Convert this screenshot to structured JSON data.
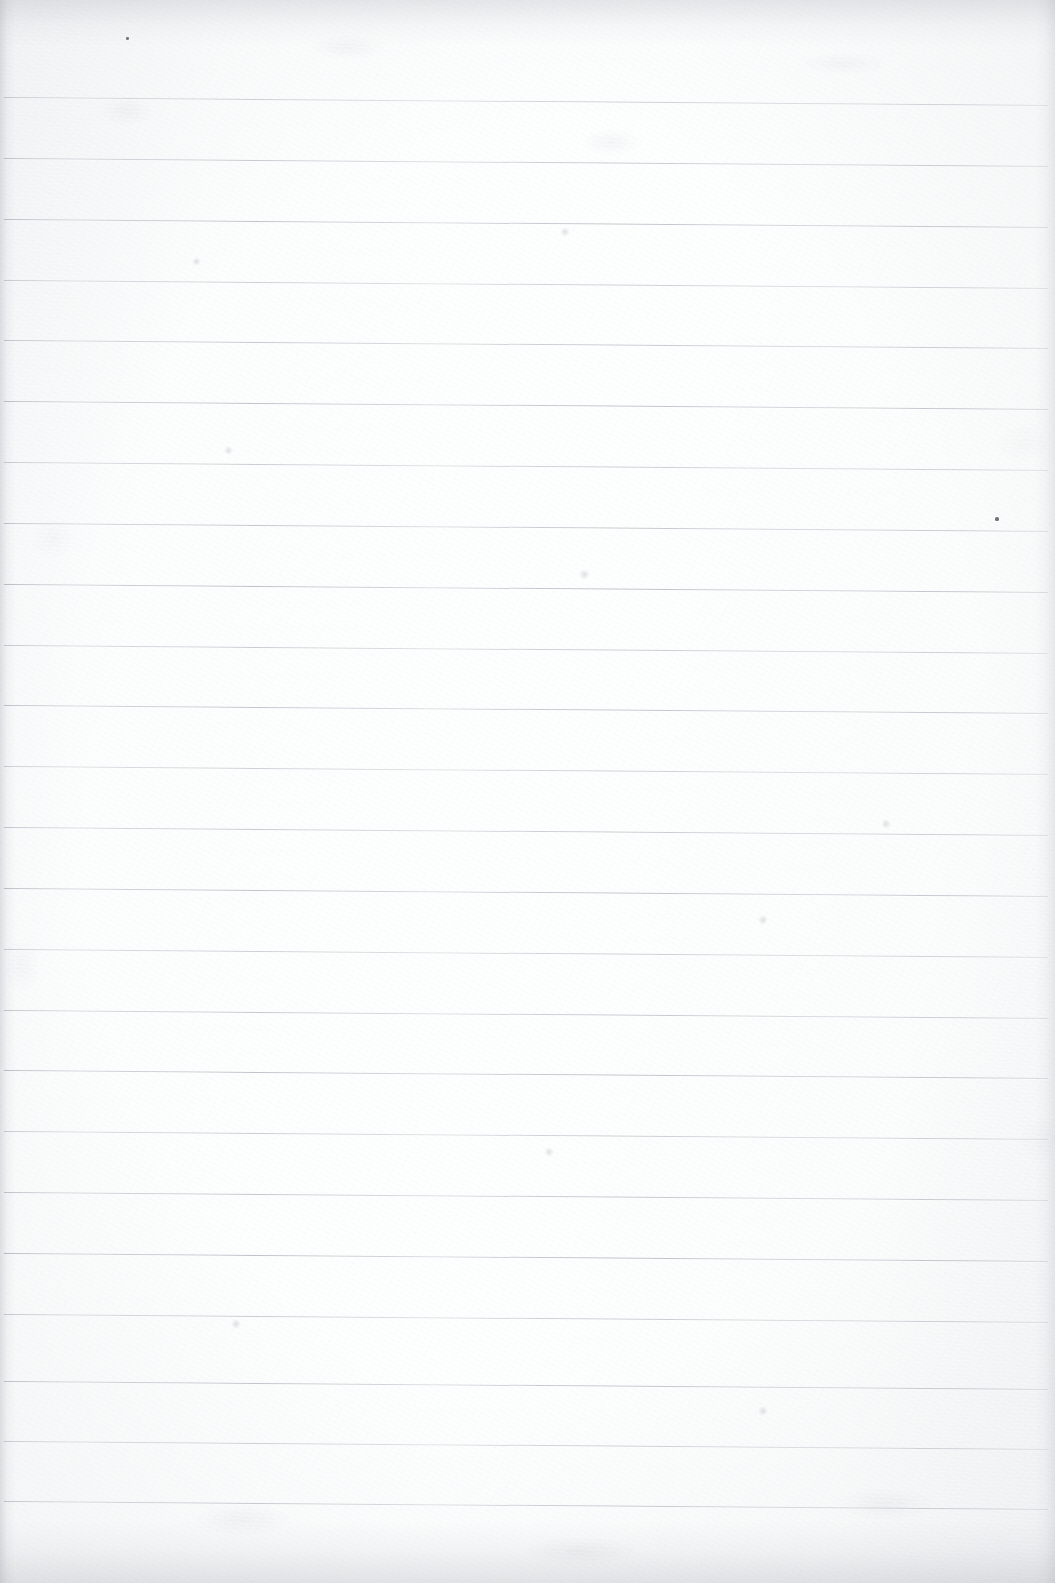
{
  "document": {
    "kind": "scanned-page",
    "surface": "blank ruled notebook paper",
    "orientation": "portrait",
    "width_px": 1055,
    "height_px": 1583,
    "written_content": "",
    "visible_text": ""
  },
  "colors": {
    "paper": "#fbfcfc",
    "paper_warm_edge": "#f6f7f8",
    "rule_line": "#a8afb7",
    "rule_line_light": "#c4cad0",
    "edge_shadow": "#92999f",
    "speck": "#6e757c"
  },
  "ruling": {
    "line_count": 24,
    "first_line_y": 97,
    "spacing_px": 60.8,
    "line_start_x": 4,
    "line_end_x": 1048,
    "line_thickness_px": 1,
    "skew_drop_px": 8,
    "description": "evenly spaced horizontal rules, slight downward skew to the right",
    "line_y": [
      97,
      158,
      219,
      280,
      340,
      401,
      462,
      523,
      584,
      645,
      705,
      766,
      827,
      888,
      949,
      1010,
      1070,
      1131,
      1192,
      1253,
      1314,
      1381,
      1441,
      1501
    ]
  },
  "artifacts": {
    "specks": [
      {
        "name": "speck-upper-left",
        "x": 126,
        "y": 37,
        "w": 3,
        "h": 3
      },
      {
        "name": "speck-right-margin",
        "x": 995,
        "y": 517,
        "w": 4,
        "h": 4
      }
    ],
    "soft_marks": [
      {
        "name": "smudge-upper-mid",
        "x": 565,
        "y": 232,
        "size": 10
      },
      {
        "name": "smudge-left-upper",
        "x": 196,
        "y": 261,
        "size": 9
      },
      {
        "name": "smudge-mid-left",
        "x": 228,
        "y": 450,
        "size": 9
      },
      {
        "name": "smudge-center",
        "x": 584,
        "y": 574,
        "size": 11
      },
      {
        "name": "smudge-right-upper",
        "x": 886,
        "y": 824,
        "size": 10
      },
      {
        "name": "smudge-right-mid",
        "x": 763,
        "y": 920,
        "size": 10
      },
      {
        "name": "smudge-center-low",
        "x": 549,
        "y": 1152,
        "size": 10
      },
      {
        "name": "smudge-left-low",
        "x": 236,
        "y": 1324,
        "size": 10
      },
      {
        "name": "smudge-right-low",
        "x": 763,
        "y": 1411,
        "size": 10
      }
    ],
    "edge_bands": {
      "top_band_height": 46,
      "bottom_band_height": 62,
      "left_band_width": 16,
      "right_band_width": 20
    }
  }
}
